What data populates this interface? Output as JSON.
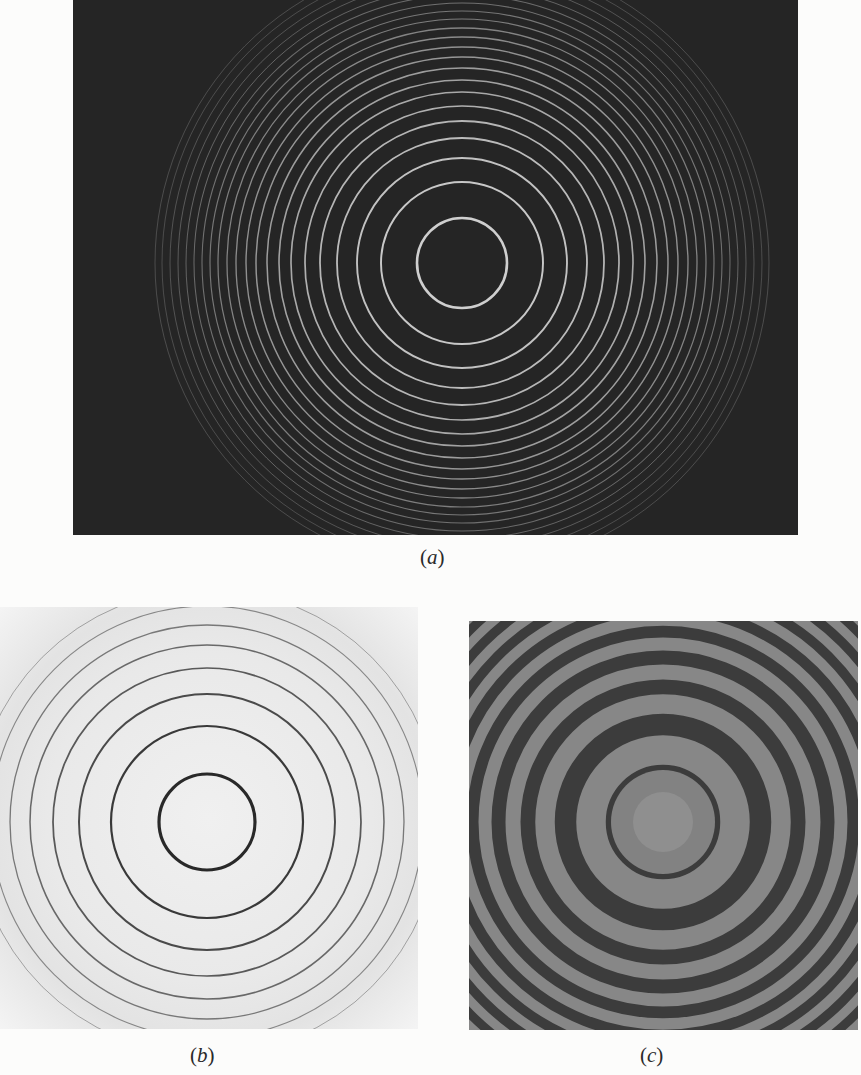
{
  "figure": {
    "panels": [
      {
        "id": "a",
        "caption_open": "(",
        "caption_label": "a",
        "caption_close": ")",
        "description": "Bright thin interference rings on dark background",
        "background": "#252525",
        "ring_color": "#d8d8d8",
        "center": [
          389,
          263
        ],
        "ring_radii": [
          45,
          81,
          105,
          125,
          142,
          157,
          171,
          183,
          195,
          206,
          216,
          226,
          235,
          244,
          252,
          260,
          268,
          276,
          284,
          292,
          300,
          307
        ]
      },
      {
        "id": "b",
        "caption_open": "(",
        "caption_label": "b",
        "caption_close": ")",
        "description": "Dark thin interference rings on light background",
        "background": "#ececec",
        "ring_color": "#1e1e1e",
        "center": [
          207,
          215
        ],
        "ring_radii": [
          48,
          96,
          128,
          154,
          177,
          197,
          216,
          233
        ]
      },
      {
        "id": "c",
        "caption_open": "(",
        "caption_label": "c",
        "caption_close": ")",
        "description": "Sinusoidal (cos-squared) interference fringes with bright center",
        "background": "#3c3c3c",
        "fringe_light": "#9a9a9a",
        "fringe_dark": "#2c2c2c",
        "center": [
          194,
          201
        ],
        "ring_radii": [
          72,
          118,
          150,
          178,
          202,
          224,
          244,
          263,
          281,
          298,
          314
        ]
      }
    ]
  }
}
